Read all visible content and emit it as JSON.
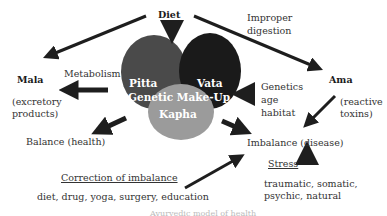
{
  "nodes": {
    "diet": "Diet",
    "improper_digestion_1": "Improper",
    "improper_digestion_2": "digestion",
    "mala": "Mala",
    "metabolism": "Metabolism",
    "excretory_1": "(excretory",
    "excretory_2": "products)",
    "ama": "Ama",
    "reactive_1": "(reactive",
    "reactive_2": "toxins)",
    "genetics_1": "Genetics",
    "genetics_2": "age",
    "genetics_3": "habitat",
    "balance": "Balance (health)",
    "imbalance": "Imbalance (disease)",
    "stress": "Stress",
    "stress_types_1": "traumatic, somatic,",
    "stress_types_2": "psychic, natural",
    "correction": "Correction of imbalance",
    "correction_methods": "diet, drug, yoga, surgery, education"
  },
  "doshas": {
    "pitta": "Pitta",
    "vata": "Vata",
    "kapha": "Kapha",
    "center_label": "Genetic Make-Up"
  },
  "colors": {
    "pitta": "#4a4a4a",
    "vata": "#1a1a1a",
    "kapha": "#9b9b9b",
    "arrow": "#1e1e1e"
  },
  "caption": "Ayurvedic model of health"
}
